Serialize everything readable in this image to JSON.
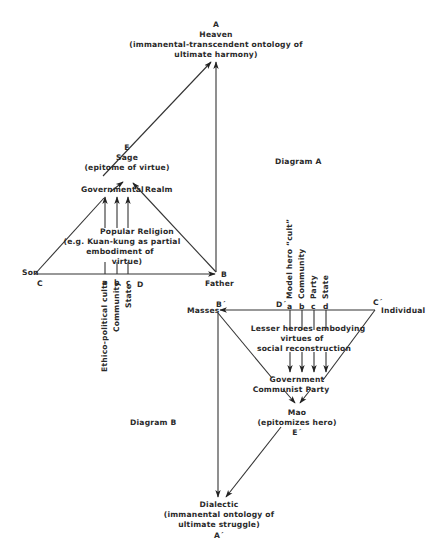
{
  "diagram_a": {
    "title": "Diagram A",
    "node_a": {
      "letter": "A",
      "name": "Heaven",
      "desc1": "(immanental-transcendent ontology of",
      "desc2": "ultimate harmony)"
    },
    "node_e": {
      "letter": "E",
      "name": "Sage",
      "desc": "(epitome of virtue)"
    },
    "governmental_realm": {
      "word1": "Governmental",
      "word2": "Realm"
    },
    "popular_religion": {
      "line1": "Popular Religion",
      "line2": "(e.g. Kuan-kung as partial",
      "line3": "embodiment of",
      "line4": "virtue)"
    },
    "node_c": {
      "letter": "C",
      "name": "Son"
    },
    "node_b": {
      "letter": "B",
      "name": "Father"
    },
    "node_d": {
      "letter": "D"
    },
    "ticks": [
      {
        "letter": "a",
        "label": "Ethico-political cults"
      },
      {
        "letter": "b",
        "label": "Community"
      },
      {
        "letter": "c",
        "label": "State"
      }
    ]
  },
  "diagram_b": {
    "title": "Diagram B",
    "node_a": {
      "letter": "A´",
      "name": "Dialectic",
      "desc1": "(immanental ontology of",
      "desc2": "ultimate struggle)"
    },
    "node_e": {
      "letter": "E´",
      "name": "Mao",
      "desc": "(epitomizes hero)"
    },
    "government": {
      "line1": "Government",
      "line2": "Communist Party"
    },
    "lesser_heroes": {
      "line1": "Lesser heroes embodying",
      "line2": "virtues of",
      "line3": "social reconstruction"
    },
    "node_b": {
      "letter": "B´",
      "name": "Masses"
    },
    "node_c": {
      "letter": "C´",
      "name": "Individual"
    },
    "node_d": {
      "letter": "D´"
    },
    "ticks": [
      {
        "letter": "a",
        "label": "Model hero “cult”"
      },
      {
        "letter": "b",
        "label": "Community"
      },
      {
        "letter": "c",
        "label": "Party"
      },
      {
        "letter": "d",
        "label": "State"
      }
    ]
  }
}
